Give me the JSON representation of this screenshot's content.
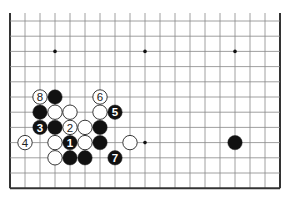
{
  "board": {
    "cols": 19,
    "rows": 12,
    "origin_x": 10,
    "origin_y": 21,
    "spacing_x": 15,
    "spacing_y": 15.2,
    "top_line_extend": 8,
    "edges": [
      "left",
      "right",
      "bottom"
    ],
    "line_color": "#888888",
    "edge_color": "#333333",
    "stone_black": "#111111",
    "stone_white": "#ffffff"
  },
  "star_points": [
    [
      3,
      2
    ],
    [
      9,
      2
    ],
    [
      15,
      2
    ],
    [
      9,
      8
    ]
  ],
  "stones": [
    {
      "col": 3,
      "row": 5,
      "color": "black",
      "label": ""
    },
    {
      "col": 2,
      "row": 5,
      "color": "white",
      "label": "8"
    },
    {
      "col": 6,
      "row": 5,
      "color": "white",
      "label": "6"
    },
    {
      "col": 2,
      "row": 6,
      "color": "black",
      "label": ""
    },
    {
      "col": 3,
      "row": 6,
      "color": "white",
      "label": ""
    },
    {
      "col": 4,
      "row": 6,
      "color": "white",
      "label": ""
    },
    {
      "col": 6,
      "row": 6,
      "color": "white",
      "label": ""
    },
    {
      "col": 7,
      "row": 6,
      "color": "black",
      "label": "5"
    },
    {
      "col": 2,
      "row": 7,
      "color": "black",
      "label": "3"
    },
    {
      "col": 3,
      "row": 7,
      "color": "black",
      "label": ""
    },
    {
      "col": 4,
      "row": 7,
      "color": "white",
      "label": "2"
    },
    {
      "col": 5,
      "row": 7,
      "color": "white",
      "label": ""
    },
    {
      "col": 6,
      "row": 7,
      "color": "black",
      "label": ""
    },
    {
      "col": 1,
      "row": 8,
      "color": "white",
      "label": "4"
    },
    {
      "col": 3,
      "row": 8,
      "color": "white",
      "label": ""
    },
    {
      "col": 4,
      "row": 8,
      "color": "black",
      "label": "1"
    },
    {
      "col": 5,
      "row": 8,
      "color": "white",
      "label": ""
    },
    {
      "col": 6,
      "row": 8,
      "color": "black",
      "label": ""
    },
    {
      "col": 8,
      "row": 8,
      "color": "white",
      "label": ""
    },
    {
      "col": 3,
      "row": 9,
      "color": "white",
      "label": ""
    },
    {
      "col": 4,
      "row": 9,
      "color": "black",
      "label": ""
    },
    {
      "col": 5,
      "row": 9,
      "color": "black",
      "label": ""
    },
    {
      "col": 7,
      "row": 9,
      "color": "black",
      "label": "7"
    },
    {
      "col": 15,
      "row": 8,
      "color": "black",
      "label": ""
    }
  ]
}
